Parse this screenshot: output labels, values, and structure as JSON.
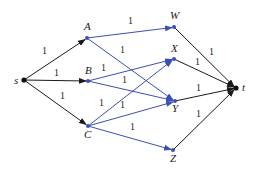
{
  "diagram": {
    "type": "flow-network",
    "colors": {
      "black_edge": "#1a1a1a",
      "blue_edge": "#3a4fb8",
      "node_black": "#111111",
      "node_blue": "#3a4fb8"
    },
    "nodes": [
      {
        "id": "s",
        "label": "s",
        "x": 24,
        "y": 80,
        "color": "black"
      },
      {
        "id": "A",
        "label": "A",
        "x": 87,
        "y": 38,
        "color": "blue"
      },
      {
        "id": "B",
        "label": "B",
        "x": 88,
        "y": 81,
        "color": "blue"
      },
      {
        "id": "C",
        "label": "C",
        "x": 88,
        "y": 126,
        "color": "blue"
      },
      {
        "id": "W",
        "label": "W",
        "x": 174,
        "y": 27,
        "color": "blue"
      },
      {
        "id": "X",
        "label": "X",
        "x": 174,
        "y": 59,
        "color": "blue"
      },
      {
        "id": "Y",
        "label": "Y",
        "x": 175,
        "y": 101,
        "color": "blue"
      },
      {
        "id": "Z",
        "label": "Z",
        "x": 173,
        "y": 150,
        "color": "blue"
      },
      {
        "id": "t",
        "label": "t",
        "x": 236,
        "y": 88,
        "color": "black"
      }
    ],
    "edges": [
      {
        "from": "s",
        "to": "A",
        "capacity": "1",
        "color": "black"
      },
      {
        "from": "s",
        "to": "B",
        "capacity": "1",
        "color": "black"
      },
      {
        "from": "s",
        "to": "C",
        "capacity": "1",
        "color": "black"
      },
      {
        "from": "A",
        "to": "W",
        "capacity": "1",
        "color": "blue"
      },
      {
        "from": "A",
        "to": "Y",
        "capacity": "1",
        "color": "blue"
      },
      {
        "from": "B",
        "to": "X",
        "capacity": "1",
        "color": "blue"
      },
      {
        "from": "B",
        "to": "Y",
        "capacity": "1",
        "color": "blue"
      },
      {
        "from": "C",
        "to": "X",
        "capacity": "1",
        "color": "blue"
      },
      {
        "from": "C",
        "to": "Y",
        "capacity": "1",
        "color": "blue"
      },
      {
        "from": "C",
        "to": "Z",
        "capacity": "1",
        "color": "blue"
      },
      {
        "from": "W",
        "to": "t",
        "capacity": "1",
        "color": "black"
      },
      {
        "from": "X",
        "to": "t",
        "capacity": "1",
        "color": "black"
      },
      {
        "from": "Y",
        "to": "t",
        "capacity": "1",
        "color": "black"
      },
      {
        "from": "Z",
        "to": "t",
        "capacity": "1",
        "color": "black"
      }
    ],
    "labels": {
      "s": "s",
      "A": "A",
      "B": "B",
      "C": "C",
      "W": "W",
      "X": "X",
      "Y": "Y",
      "Z": "Z",
      "t": "t",
      "cap": "1"
    }
  }
}
